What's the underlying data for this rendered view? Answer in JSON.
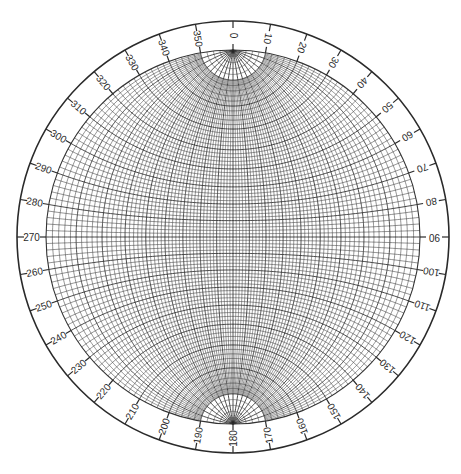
{
  "diagram": {
    "type": "stereographic-net",
    "name": "Wulff net",
    "orientation": "poles at top (0) and bottom (180)",
    "grid_interval_deg": 2,
    "major_interval_deg": 10,
    "polar_cap_latitude_deg": 80,
    "colors": {
      "background": "#ffffff",
      "lines": "#2a2a2a"
    },
    "geometry": {
      "center_x": 233,
      "center_y": 237,
      "outer_radius": 216,
      "net_radius": 187
    },
    "azimuth_ring": {
      "label_interval_deg": 10,
      "labels": [
        "0",
        "10",
        "20",
        "30",
        "40",
        "50",
        "60",
        "70",
        "80",
        "90",
        "100",
        "110",
        "120",
        "130",
        "140",
        "150",
        "160",
        "170",
        "180",
        "190",
        "200",
        "210",
        "220",
        "230",
        "240",
        "250",
        "260",
        "270",
        "280",
        "290",
        "300",
        "310",
        "320",
        "330",
        "340",
        "350"
      ]
    }
  }
}
